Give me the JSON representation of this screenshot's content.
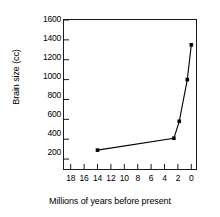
{
  "chart_data": {
    "type": "line",
    "title": "",
    "xlabel": "Millions of years before present",
    "ylabel": "Brain size (cc)",
    "xlim": [
      19,
      -0.7
    ],
    "ylim": [
      100,
      1600
    ],
    "x_ticks": [
      18,
      16,
      14,
      12,
      10,
      8,
      6,
      4,
      2,
      0
    ],
    "x_tick_labels": [
      "18",
      "16",
      "14",
      "12",
      "10",
      "8",
      "6",
      "4",
      "2",
      "0"
    ],
    "y_ticks": [
      200,
      400,
      600,
      800,
      1000,
      1200,
      1400,
      1600
    ],
    "y_tick_labels": [
      "200",
      "400",
      "600",
      "800",
      "1000",
      "1200",
      "1400",
      "1600"
    ],
    "x_axis_inverted": true,
    "grid": false,
    "legend": false,
    "marker": "filled-square",
    "line_color": "#000000",
    "series": [
      {
        "name": "Brain size",
        "x": [
          14.0,
          2.6,
          1.8,
          0.6,
          0.0
        ],
        "y": [
          290,
          410,
          580,
          1000,
          1350
        ]
      }
    ]
  },
  "axis_titles": {
    "x": "Millions of years before present",
    "y": "Brain size (cc)"
  }
}
